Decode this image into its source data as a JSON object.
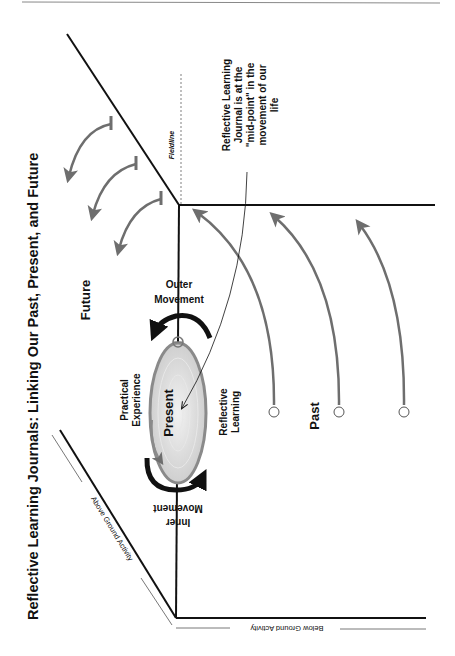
{
  "title": "Reflective Learning Journals: Linking Our Past, Present, and Future",
  "labels": {
    "future": "Future",
    "past": "Past",
    "present": "Present",
    "practical_experience_1": "Practical",
    "practical_experience_2": "Experience",
    "reflective_learning_1": "Reflective",
    "reflective_learning_2": "Learning",
    "outer_movement_1": "Outer",
    "outer_movement_2": "Movement",
    "inner_movement_1": "Inner",
    "inner_movement_2": "Movement",
    "fieldline": "Fieldline",
    "above_ground": "Above Ground Activity",
    "below_ground": "Below Ground Activity"
  },
  "annotation": {
    "line1": "Reflective Learning",
    "line2": "Journal is at the",
    "line3": "\"mid-point\" in the",
    "line4": "movement of our",
    "line5": "life"
  },
  "colors": {
    "line": "#111111",
    "arrow_gray": "#6e6e6e",
    "ellipse_fill": "#d9d9d9",
    "ellipse_stroke": "#8a8a8a",
    "thin_line": "#555555",
    "fieldline": "#aaaaaa"
  }
}
